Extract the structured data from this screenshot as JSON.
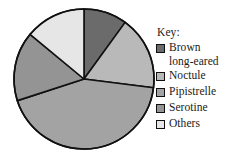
{
  "legend": {
    "title": "Key:",
    "items": [
      {
        "label": "Brown\nlong-eared",
        "color": "#6b6b6b"
      },
      {
        "label": "Noctule",
        "color": "#b9b9b9"
      },
      {
        "label": "Pipistrelle",
        "color": "#a3a3a3"
      },
      {
        "label": "Serotine",
        "color": "#949494"
      },
      {
        "label": "Others",
        "color": "#e6e6e6"
      }
    ]
  },
  "chart_data": {
    "type": "pie",
    "title": "",
    "legend_title": "Key:",
    "legend_position": "right",
    "start_angle": 0,
    "direction": "clockwise",
    "categories": [
      "Brown long-eared",
      "Noctule",
      "Pipistrelle",
      "Serotine",
      "Others"
    ],
    "values": [
      10,
      17,
      43,
      16,
      14
    ],
    "units": "percent",
    "colors": [
      "#6b6b6b",
      "#b9b9b9",
      "#a3a3a3",
      "#949494",
      "#e6e6e6"
    ],
    "slice_angles_deg": [
      35,
      60,
      155,
      58,
      52
    ],
    "outline_color": "#111111",
    "grid": false
  }
}
